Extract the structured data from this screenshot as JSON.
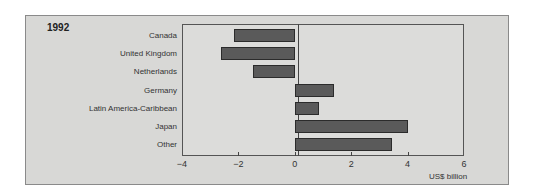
{
  "chart_data": {
    "type": "bar",
    "orientation": "horizontal",
    "title": "1992",
    "categories": [
      "Canada",
      "United Kingdom",
      "Netherlands",
      "Germany",
      "Latin America-Caribbean",
      "Japan",
      "Other"
    ],
    "values": [
      -2.15,
      -2.6,
      -1.5,
      1.4,
      0.85,
      4.0,
      3.45
    ],
    "xlabel": "US$ billion",
    "ylabel": "",
    "xlim": [
      -4,
      6
    ],
    "xticks": [
      -4,
      -2,
      0,
      2,
      4,
      6
    ],
    "xtick_labels": [
      "−4",
      "−2",
      "0",
      "2",
      "4",
      "6"
    ],
    "grid": false,
    "legend": null,
    "colors": {
      "bar_fill": "#5a5a5a",
      "bar_edge": "#2b2b2b",
      "panel": "#d8d8d6"
    }
  }
}
